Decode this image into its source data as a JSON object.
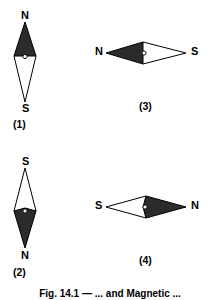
{
  "figure": {
    "caption": "Fig. 14.1 — ... and Magnetic ...",
    "needle_fill_dark": "#2b2b2b",
    "needle_fill_light": "#ffffff",
    "outline_color": "#000000",
    "pivot_color": "#ffffff",
    "panels": [
      {
        "id": "panel-1",
        "number": "(1)",
        "orientation": "vertical",
        "labels": {
          "top": "N",
          "bottom": "S"
        },
        "dark_half": "top",
        "light_half": "bottom"
      },
      {
        "id": "panel-2",
        "number": "(2)",
        "orientation": "vertical",
        "labels": {
          "top": "S",
          "bottom": "N"
        },
        "dark_half": "bottom",
        "light_half": "top"
      },
      {
        "id": "panel-3",
        "number": "(3)",
        "orientation": "horizontal",
        "labels": {
          "left": "N",
          "right": "S"
        },
        "dark_half": "left",
        "light_half": "right"
      },
      {
        "id": "panel-4",
        "number": "(4)",
        "orientation": "horizontal",
        "labels": {
          "left": "S",
          "right": "N"
        },
        "dark_half": "right",
        "light_half": "left"
      }
    ]
  }
}
